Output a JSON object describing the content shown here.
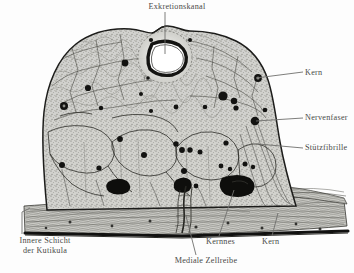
{
  "figure": {
    "kind": "histological-cross-section-drawing",
    "ink_color": "#1d1d1b",
    "label_color": "#4a4a48",
    "leader_color": "#6f6f6d",
    "background_color": "#fdfdfd",
    "tissue_fill": "#cfcfcb",
    "cuticle_color": "#111110"
  },
  "labels": {
    "excretory_canal": "Exkretionskanal",
    "nucleus_right": "Kern",
    "nerve_fiber": "Nervenfaser",
    "support_fibril": "Stützfibrille",
    "inner_layer_line1": "Innere Schicht",
    "inner_layer_line2": "der Kutikula",
    "nucleus_nest": "Kernnes",
    "nucleus_bottom": "Kern",
    "medial_cell_row": "Mediale Zellreibe"
  },
  "structures": {
    "canal": {
      "name": "Exkretionskanal",
      "lumen_fill": "#ffffff",
      "wall": "#141412"
    },
    "nuclei": {
      "name": "Kern",
      "fill": "#131311"
    },
    "nuclei_nest": {
      "name": "Kernnest",
      "fill": "#0e0e0c"
    },
    "cuticle": {
      "name": "Innere Schicht der Kutikula"
    },
    "medial_row": {
      "name": "Mediale Zellreihe"
    }
  }
}
